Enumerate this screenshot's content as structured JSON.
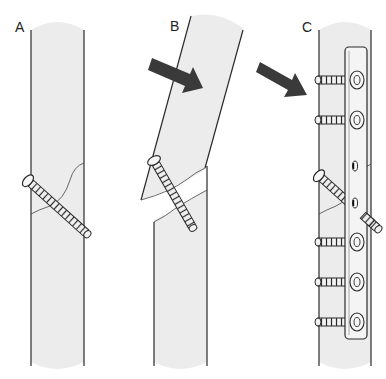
{
  "figure": {
    "panels": [
      {
        "id": "A",
        "label": "A",
        "description": "Bone with oblique fracture fixed by a single lag screw"
      },
      {
        "id": "B",
        "label": "B",
        "description": "Bending force (arrow) displaces fracture; lag screw alone fails"
      },
      {
        "id": "C",
        "label": "C",
        "description": "Lag screw protected by neutralization plate with six cortical screws"
      }
    ],
    "colors": {
      "bone_fill": "#ececec",
      "outline": "#2a2a2a",
      "arrow": "#3a3a3a",
      "plate_fill": "#f4f4f4",
      "background": "#ffffff"
    },
    "plate": {
      "screw_holes_filled": 6,
      "screw_holes_empty": 2
    }
  }
}
